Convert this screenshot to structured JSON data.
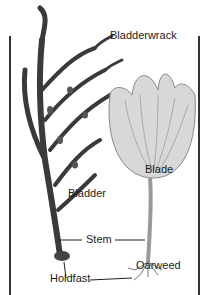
{
  "diagram": {
    "labels": {
      "bladderwrack": "Bladderwrack",
      "bladder": "Bladder",
      "stem": "Stem",
      "holdfast": "Holdfast",
      "blade": "Blade",
      "oarweed": "Oarweed"
    },
    "specimens": [
      "Bladderwrack",
      "Oarweed"
    ],
    "colors": {
      "bladderwrack": "#3a3a3a",
      "oarweed": "#c8c8c8",
      "frame": "#333333",
      "text": "#1a1a1a"
    }
  }
}
